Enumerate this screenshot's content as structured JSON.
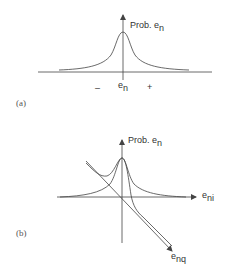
{
  "panel_a": {
    "label": "(a)",
    "y_axis_label": "Prob. e",
    "y_axis_label_sub": "n",
    "x_center_label": "e",
    "x_center_label_sub": "n",
    "minus_label": "–",
    "plus_label": "+"
  },
  "panel_b": {
    "label": "(b)",
    "y_axis_label": "Prob. e",
    "y_axis_label_sub": "n",
    "x_axis_label": "e",
    "x_axis_label_sub": "ni",
    "diag_axis_label": "e",
    "diag_axis_label_sub": "nq"
  },
  "colors": {
    "line": "#444444",
    "text": "#333333"
  }
}
